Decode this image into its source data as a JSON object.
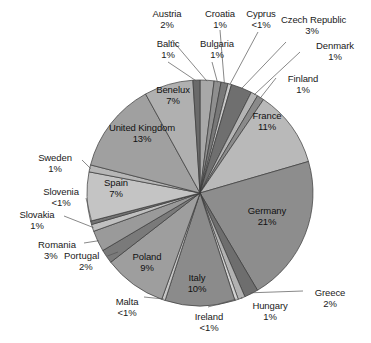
{
  "chart_data": {
    "type": "pie",
    "title": "",
    "subtitle": "",
    "xlabel": "",
    "ylabel": "",
    "legend_position": "none",
    "grid": false,
    "label_format": "name + percentage",
    "start_angle_deg": 0,
    "direction": "clockwise",
    "categories": [
      "Austria",
      "Bulgaria",
      "Croatia",
      "Cyprus",
      "Czech Republic",
      "Denmark",
      "Finland",
      "France",
      "Germany",
      "Greece",
      "Hungary",
      "Ireland",
      "Italy",
      "Malta",
      "Poland",
      "Portugal",
      "Romania",
      "Slovakia",
      "Slovenia",
      "Spain",
      "Sweden",
      "United Kingdom",
      "Benelux",
      "Baltic"
    ],
    "values": [
      2,
      1,
      1,
      0.5,
      3,
      1,
      1,
      11,
      21,
      2,
      1,
      0.5,
      10,
      0.5,
      9,
      2,
      3,
      1,
      0.5,
      7,
      1,
      13,
      7,
      1
    ],
    "value_labels": [
      "2%",
      "1%",
      "1%",
      "<1%",
      "3%",
      "1%",
      "1%",
      "11%",
      "21%",
      "2%",
      "1%",
      "<1%",
      "10%",
      "<1%",
      "9%",
      "2%",
      "3%",
      "1%",
      "<1%",
      "7%",
      "1%",
      "13%",
      "7%",
      "1%"
    ],
    "colors": [
      "#a8a8a8",
      "#8f8f8f",
      "#787878",
      "#c9c9c9",
      "#6f6f6f",
      "#b4b4b4",
      "#8a8a8a",
      "#b9b9b9",
      "#8d8d8d",
      "#6e6e6e",
      "#b2b2b2",
      "#d2d2d2",
      "#8b8b8b",
      "#c6c6c6",
      "#9e9e9e",
      "#7a7a7a",
      "#9a9a9a",
      "#c0c0c0",
      "#747474",
      "#c4c4c4",
      "#b6b6b6",
      "#a0a0a0",
      "#b0b0b0",
      "#6a6a6a"
    ],
    "slices": [
      {
        "name": "Austria",
        "value": 2,
        "label": "2%",
        "placement": "outside"
      },
      {
        "name": "Bulgaria",
        "value": 1,
        "label": "1%",
        "placement": "outside"
      },
      {
        "name": "Croatia",
        "value": 1,
        "label": "1%",
        "placement": "outside"
      },
      {
        "name": "Cyprus",
        "value": 0.5,
        "label": "<1%",
        "placement": "outside"
      },
      {
        "name": "Czech Republic",
        "value": 3,
        "label": "3%",
        "placement": "outside"
      },
      {
        "name": "Denmark",
        "value": 1,
        "label": "1%",
        "placement": "outside"
      },
      {
        "name": "Finland",
        "value": 1,
        "label": "1%",
        "placement": "outside"
      },
      {
        "name": "France",
        "value": 11,
        "label": "11%",
        "placement": "inside"
      },
      {
        "name": "Germany",
        "value": 21,
        "label": "21%",
        "placement": "inside"
      },
      {
        "name": "Greece",
        "value": 2,
        "label": "2%",
        "placement": "outside"
      },
      {
        "name": "Hungary",
        "value": 1,
        "label": "1%",
        "placement": "outside"
      },
      {
        "name": "Ireland",
        "value": 0.5,
        "label": "<1%",
        "placement": "outside"
      },
      {
        "name": "Italy",
        "value": 10,
        "label": "10%",
        "placement": "inside"
      },
      {
        "name": "Malta",
        "value": 0.5,
        "label": "<1%",
        "placement": "outside"
      },
      {
        "name": "Poland",
        "value": 9,
        "label": "9%",
        "placement": "inside"
      },
      {
        "name": "Portugal",
        "value": 2,
        "label": "2%",
        "placement": "outside"
      },
      {
        "name": "Romania",
        "value": 3,
        "label": "3%",
        "placement": "outside"
      },
      {
        "name": "Slovakia",
        "value": 1,
        "label": "1%",
        "placement": "outside"
      },
      {
        "name": "Slovenia",
        "value": 0.5,
        "label": "<1%",
        "placement": "outside"
      },
      {
        "name": "Spain",
        "value": 7,
        "label": "7%",
        "placement": "inside"
      },
      {
        "name": "Sweden",
        "value": 1,
        "label": "1%",
        "placement": "outside"
      },
      {
        "name": "United Kingdom",
        "value": 13,
        "label": "13%",
        "placement": "inside"
      },
      {
        "name": "Benelux",
        "value": 7,
        "label": "7%",
        "placement": "inside"
      },
      {
        "name": "Baltic",
        "value": 1,
        "label": "1%",
        "placement": "outside"
      }
    ]
  },
  "labels": {
    "austria": {
      "name": "Austria",
      "pct": "2%"
    },
    "baltic": {
      "name": "Baltic",
      "pct": "1%"
    },
    "bulgaria": {
      "name": "Bulgaria",
      "pct": "1%"
    },
    "croatia": {
      "name": "Croatia",
      "pct": "1%"
    },
    "cyprus": {
      "name": "Cyprus",
      "pct": "<1%"
    },
    "czech_republic": {
      "name": "Czech Republic",
      "pct": "3%"
    },
    "denmark": {
      "name": "Denmark",
      "pct": "1%"
    },
    "finland": {
      "name": "Finland",
      "pct": "1%"
    },
    "france": {
      "name": "France",
      "pct": "11%"
    },
    "germany": {
      "name": "Germany",
      "pct": "21%"
    },
    "greece": {
      "name": "Greece",
      "pct": "2%"
    },
    "hungary": {
      "name": "Hungary",
      "pct": "1%"
    },
    "ireland": {
      "name": "Ireland",
      "pct": "<1%"
    },
    "italy": {
      "name": "Italy",
      "pct": "10%"
    },
    "malta": {
      "name": "Malta",
      "pct": "<1%"
    },
    "poland": {
      "name": "Poland",
      "pct": "9%"
    },
    "portugal": {
      "name": "Portugal",
      "pct": "2%"
    },
    "romania": {
      "name": "Romania",
      "pct": "3%"
    },
    "slovakia": {
      "name": "Slovakia",
      "pct": "1%"
    },
    "slovenia": {
      "name": "Slovenia",
      "pct": "<1%"
    },
    "spain": {
      "name": "Spain",
      "pct": "7%"
    },
    "sweden": {
      "name": "Sweden",
      "pct": "1%"
    },
    "united_kingdom": {
      "name": "United Kingdom",
      "pct": "13%"
    },
    "benelux": {
      "name": "Benelux",
      "pct": "7%"
    }
  }
}
